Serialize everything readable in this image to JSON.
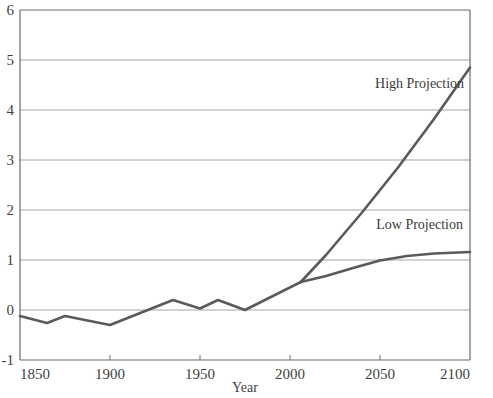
{
  "chart_data": {
    "type": "line",
    "title": "",
    "subtitle": "",
    "xlabel": "Year",
    "ylabel": "",
    "xlim": [
      1850,
      2100
    ],
    "ylim": [
      -1,
      6
    ],
    "grid": "horizontal",
    "legend_position": "inline-annotations",
    "xticks": [
      1850,
      1900,
      1950,
      2000,
      2050,
      2100
    ],
    "xtick_labels": [
      "1850",
      "1900",
      "1950",
      "2000",
      "2050",
      "2100"
    ],
    "yticks": [
      -1,
      0,
      1,
      2,
      3,
      4,
      5,
      6
    ],
    "ytick_labels": [
      "-1",
      "0",
      "1",
      "2",
      "3",
      "4",
      "5",
      "6"
    ],
    "line_color": "#5a5a5a",
    "grid_color": "#9a9a9a",
    "axis_color": "#6a6a6a",
    "series": [
      {
        "name": "Observed",
        "annotation": "",
        "x": [
          1850,
          1865,
          1875,
          1900,
          1935,
          1950,
          1960,
          1975,
          2006
        ],
        "values": [
          -0.12,
          -0.26,
          -0.12,
          -0.3,
          0.2,
          0.03,
          0.2,
          0.0,
          0.56
        ]
      },
      {
        "name": "High Projection",
        "annotation": "High Projection",
        "x": [
          2006,
          2020,
          2040,
          2060,
          2080,
          2100
        ],
        "values": [
          0.56,
          1.1,
          1.95,
          2.85,
          3.82,
          4.85
        ]
      },
      {
        "name": "Low Projection",
        "annotation": "Low Projection",
        "x": [
          2006,
          2020,
          2035,
          2050,
          2065,
          2080,
          2100
        ],
        "values": [
          0.56,
          0.68,
          0.84,
          0.99,
          1.08,
          1.13,
          1.16
        ]
      }
    ],
    "annotations": [
      {
        "text": "High Projection",
        "x": 2072,
        "y": 4.45
      },
      {
        "text": "Low Projection",
        "x": 2072,
        "y": 1.62
      }
    ]
  }
}
